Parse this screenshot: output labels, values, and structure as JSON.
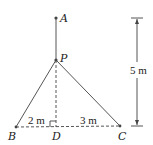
{
  "diagram": {
    "points": {
      "A": {
        "label": "A"
      },
      "P": {
        "label": "P"
      },
      "B": {
        "label": "B"
      },
      "D": {
        "label": "D"
      },
      "C": {
        "label": "C"
      }
    },
    "measurements": {
      "BD": "2 m",
      "DC": "3 m",
      "height": "5 m"
    },
    "colors": {
      "line": "#555555",
      "text": "#222222"
    }
  }
}
